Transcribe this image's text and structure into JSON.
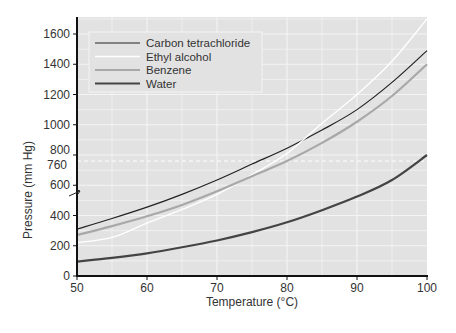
{
  "chart_data": {
    "type": "line",
    "title": "",
    "xlabel": "Temperature (°C)",
    "ylabel": "Pressure (mm Hg)",
    "xlim": [
      50,
      100
    ],
    "ylim": [
      0,
      1700
    ],
    "x_ticks": [
      50,
      60,
      70,
      80,
      90,
      100
    ],
    "y_ticks": [
      0,
      200,
      400,
      600,
      760,
      800,
      1000,
      1200,
      1400,
      1600
    ],
    "grid": true,
    "reference_line": {
      "y": 760,
      "style": "dashed",
      "label": "760"
    },
    "legend_position": "upper-left",
    "x": [
      50,
      55,
      60,
      65,
      70,
      75,
      80,
      85,
      90,
      95,
      100
    ],
    "series": [
      {
        "name": "Carbon tetrachloride",
        "color": "#222222",
        "width": 1.2,
        "values": [
          310,
          380,
          455,
          540,
          635,
          740,
          845,
          965,
          1100,
          1280,
          1490
        ]
      },
      {
        "name": "Ethyl alcohol",
        "color": "#ffffff",
        "width": 1.3,
        "values": [
          220,
          255,
          350,
          440,
          540,
          670,
          810,
          1010,
          1200,
          1420,
          1700
        ]
      },
      {
        "name": "Benzene",
        "color": "#a8a8a8",
        "width": 2.2,
        "values": [
          270,
          330,
          395,
          470,
          560,
          660,
          760,
          880,
          1020,
          1190,
          1400
        ]
      },
      {
        "name": "Water",
        "color": "#444444",
        "width": 2.2,
        "values": [
          95,
          120,
          150,
          190,
          235,
          290,
          355,
          435,
          525,
          635,
          800
        ]
      }
    ]
  }
}
